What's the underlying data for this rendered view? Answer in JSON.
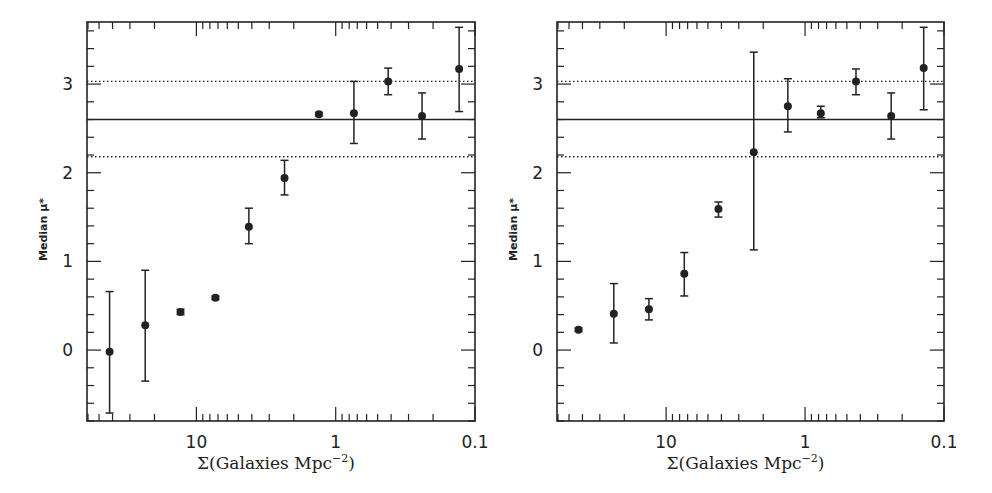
{
  "chart_data": [
    {
      "type": "scatter",
      "panel": "left",
      "title": "",
      "xlabel": "Σ(Galaxies Mpc⁻²)",
      "ylabel": "Median μ*",
      "xscale": "log",
      "x_reversed": true,
      "xlim": [
        61,
        0.1
      ],
      "ylim": [
        -0.8,
        3.7
      ],
      "xticks": [
        10,
        1,
        0.1
      ],
      "xtick_labels": [
        "10",
        "1",
        "0.1"
      ],
      "yticks": [
        0,
        1,
        2,
        3
      ],
      "ytick_labels": [
        "0",
        "1",
        "2",
        "3"
      ],
      "grid": false,
      "legend": null,
      "reference_lines": [
        {
          "y": 3.03,
          "style": "dotted"
        },
        {
          "y": 2.6,
          "style": "solid"
        },
        {
          "y": 2.18,
          "style": "dotted"
        }
      ],
      "points": [
        {
          "x": 42,
          "y": -0.02,
          "y_hi": 0.66,
          "y_lo": -0.71
        },
        {
          "x": 23.3,
          "y": 0.28,
          "y_hi": 0.9,
          "y_lo": -0.35
        },
        {
          "x": 13.0,
          "y": 0.43,
          "y_hi": 0.46,
          "y_lo": 0.4
        },
        {
          "x": 7.3,
          "y": 0.59,
          "y_hi": 0.61,
          "y_lo": 0.57
        },
        {
          "x": 4.2,
          "y": 1.39,
          "y_hi": 1.6,
          "y_lo": 1.2
        },
        {
          "x": 2.33,
          "y": 1.94,
          "y_hi": 2.14,
          "y_lo": 1.75
        },
        {
          "x": 1.32,
          "y": 2.66,
          "y_hi": 2.68,
          "y_lo": 2.64
        },
        {
          "x": 0.74,
          "y": 2.67,
          "y_hi": 3.03,
          "y_lo": 2.33
        },
        {
          "x": 0.42,
          "y": 3.03,
          "y_hi": 3.18,
          "y_lo": 2.88
        },
        {
          "x": 0.24,
          "y": 2.64,
          "y_hi": 2.9,
          "y_lo": 2.38
        },
        {
          "x": 0.13,
          "y": 3.17,
          "y_hi": 3.64,
          "y_lo": 2.69
        }
      ]
    },
    {
      "type": "scatter",
      "panel": "right",
      "title": "",
      "xlabel": "Σ(Galaxies Mpc⁻²)",
      "ylabel": "Median μ*",
      "xscale": "log",
      "x_reversed": true,
      "xlim": [
        61,
        0.1
      ],
      "ylim": [
        -0.8,
        3.7
      ],
      "xticks": [
        10,
        1,
        0.1
      ],
      "xtick_labels": [
        "10",
        "1",
        "0.1"
      ],
      "yticks": [
        0,
        1,
        2,
        3
      ],
      "ytick_labels": [
        "0",
        "1",
        "2",
        "3"
      ],
      "grid": false,
      "legend": null,
      "reference_lines": [
        {
          "y": 3.03,
          "style": "dotted"
        },
        {
          "y": 2.6,
          "style": "solid"
        },
        {
          "y": 2.18,
          "style": "dotted"
        }
      ],
      "points": [
        {
          "x": 42.7,
          "y": 0.23,
          "y_hi": 0.25,
          "y_lo": 0.21
        },
        {
          "x": 23.8,
          "y": 0.41,
          "y_hi": 0.75,
          "y_lo": 0.08
        },
        {
          "x": 13.3,
          "y": 0.46,
          "y_hi": 0.58,
          "y_lo": 0.34
        },
        {
          "x": 7.4,
          "y": 0.86,
          "y_hi": 1.1,
          "y_lo": 0.61
        },
        {
          "x": 4.2,
          "y": 1.59,
          "y_hi": 1.67,
          "y_lo": 1.5
        },
        {
          "x": 2.34,
          "y": 2.23,
          "y_hi": 3.36,
          "y_lo": 1.13
        },
        {
          "x": 1.33,
          "y": 2.75,
          "y_hi": 3.06,
          "y_lo": 2.46
        },
        {
          "x": 0.77,
          "y": 2.67,
          "y_hi": 2.75,
          "y_lo": 2.62
        },
        {
          "x": 0.43,
          "y": 3.03,
          "y_hi": 3.17,
          "y_lo": 2.88
        },
        {
          "x": 0.24,
          "y": 2.64,
          "y_hi": 2.9,
          "y_lo": 2.38
        },
        {
          "x": 0.14,
          "y": 3.18,
          "y_hi": 3.64,
          "y_lo": 2.71
        }
      ]
    }
  ],
  "layout": {
    "panels": [
      {
        "left": 87,
        "right": 475,
        "top": 22,
        "bottom": 421
      },
      {
        "left": 557,
        "right": 944,
        "top": 22,
        "bottom": 421
      }
    ],
    "line_color": "#222222",
    "marker_color": "#222222"
  }
}
